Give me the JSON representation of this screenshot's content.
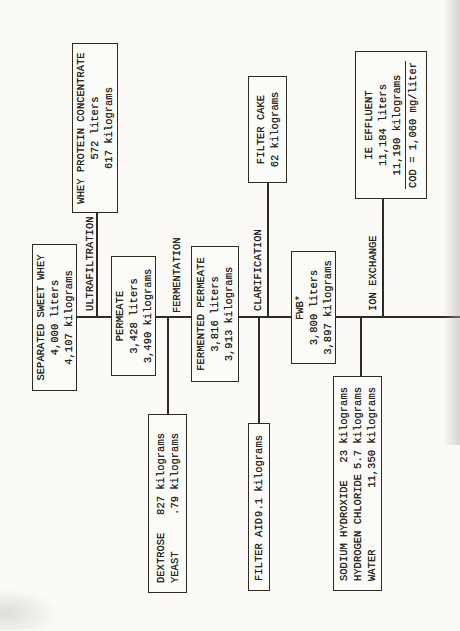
{
  "diagram": {
    "colors": {
      "ink": "#2e2a24",
      "paper": "#fbfaf7"
    },
    "process_labels": {
      "ultrafiltration": "ULTRAFILTRATION",
      "fermentation": "FERMENTATION",
      "clarification": "CLARIFICATION",
      "ion_exchange": "ION EXCHANGE"
    },
    "boxes": {
      "separated_sweet_whey": {
        "lines": [
          "SEPARATED SWEET WHEY",
          "4,000 liters",
          "4,107 kilograms"
        ]
      },
      "whey_protein_concentrate": {
        "lines": [
          "WHEY PROTEIN CONCENTRATE",
          "572 liters",
          "617 kilograms"
        ]
      },
      "permeate": {
        "lines": [
          "PERMEATE",
          "3,428 liters",
          "3,490 kilograms"
        ]
      },
      "dextrose_yeast": {
        "rows": [
          {
            "name": "DEXTROSE",
            "amount": "827 kilograms"
          },
          {
            "name": "YEAST",
            "amount": ".79 kilograms"
          }
        ]
      },
      "fermented_permeate": {
        "lines": [
          "FERMENTED PERMEATE",
          "3,816 liters",
          "3,913 kilograms"
        ]
      },
      "filter_aid": {
        "rows": [
          {
            "name": "FILTER AID",
            "amount": "9.1 kilograms"
          }
        ]
      },
      "filter_cake": {
        "lines": [
          "FILTER CAKE",
          "62 kilograms"
        ]
      },
      "fwb": {
        "lines": [
          "FWB*",
          "3,800 liters",
          "3,897 kilograms"
        ]
      },
      "ion_exchange_inputs": {
        "rows": [
          {
            "name": "SODIUM HYDROXIDE",
            "amount": "23 kilograms"
          },
          {
            "name": "HYDROGEN CHLORIDE",
            "amount": "5.7 kilograms"
          },
          {
            "name": "WATER",
            "amount": "11,350 kilograms"
          }
        ]
      },
      "ie_effluent": {
        "lines": [
          "IE EFFLUENT",
          "11,184 liters",
          "11,190 kilograms",
          "COD = 1,060 mg/liter"
        ]
      }
    }
  }
}
